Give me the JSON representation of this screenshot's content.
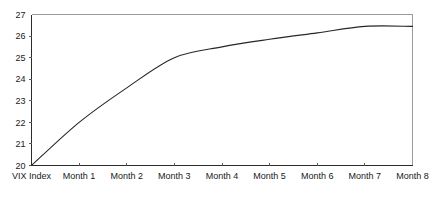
{
  "chart_data": {
    "type": "line",
    "title": "",
    "subtitle": "",
    "xlabel": "",
    "ylabel": "",
    "categories": [
      "VIX Index",
      "Month 1",
      "Month 2",
      "Month 3",
      "Month 4",
      "Month 5",
      "Month 6",
      "Month 7",
      "Month 8"
    ],
    "values": [
      20.0,
      22.0,
      23.6,
      25.0,
      25.5,
      25.85,
      26.15,
      26.45,
      26.45
    ],
    "series": [
      {
        "name": "VIX futures term structure",
        "values": [
          20.0,
          22.0,
          23.6,
          25.0,
          25.5,
          25.85,
          26.15,
          26.45,
          26.45
        ]
      }
    ],
    "ylim": [
      20,
      27
    ],
    "ytick_labels": [
      "20",
      "21",
      "22",
      "23",
      "24",
      "25",
      "26",
      "27"
    ],
    "ytick_values": [
      20,
      21,
      22,
      23,
      24,
      25,
      26,
      27
    ],
    "xtick_labels": [
      "VIX Index",
      "Month 1",
      "Month 2",
      "Month 3",
      "Month 4",
      "Month 5",
      "Month 6",
      "Month 7",
      "Month 8"
    ],
    "grid": false,
    "legend": "none",
    "line_color": "#262626",
    "axis_color": "#2b2b2b",
    "frame_color": "#9a9a9a",
    "background_color": "#ffffff",
    "markers": false,
    "annotations": []
  }
}
